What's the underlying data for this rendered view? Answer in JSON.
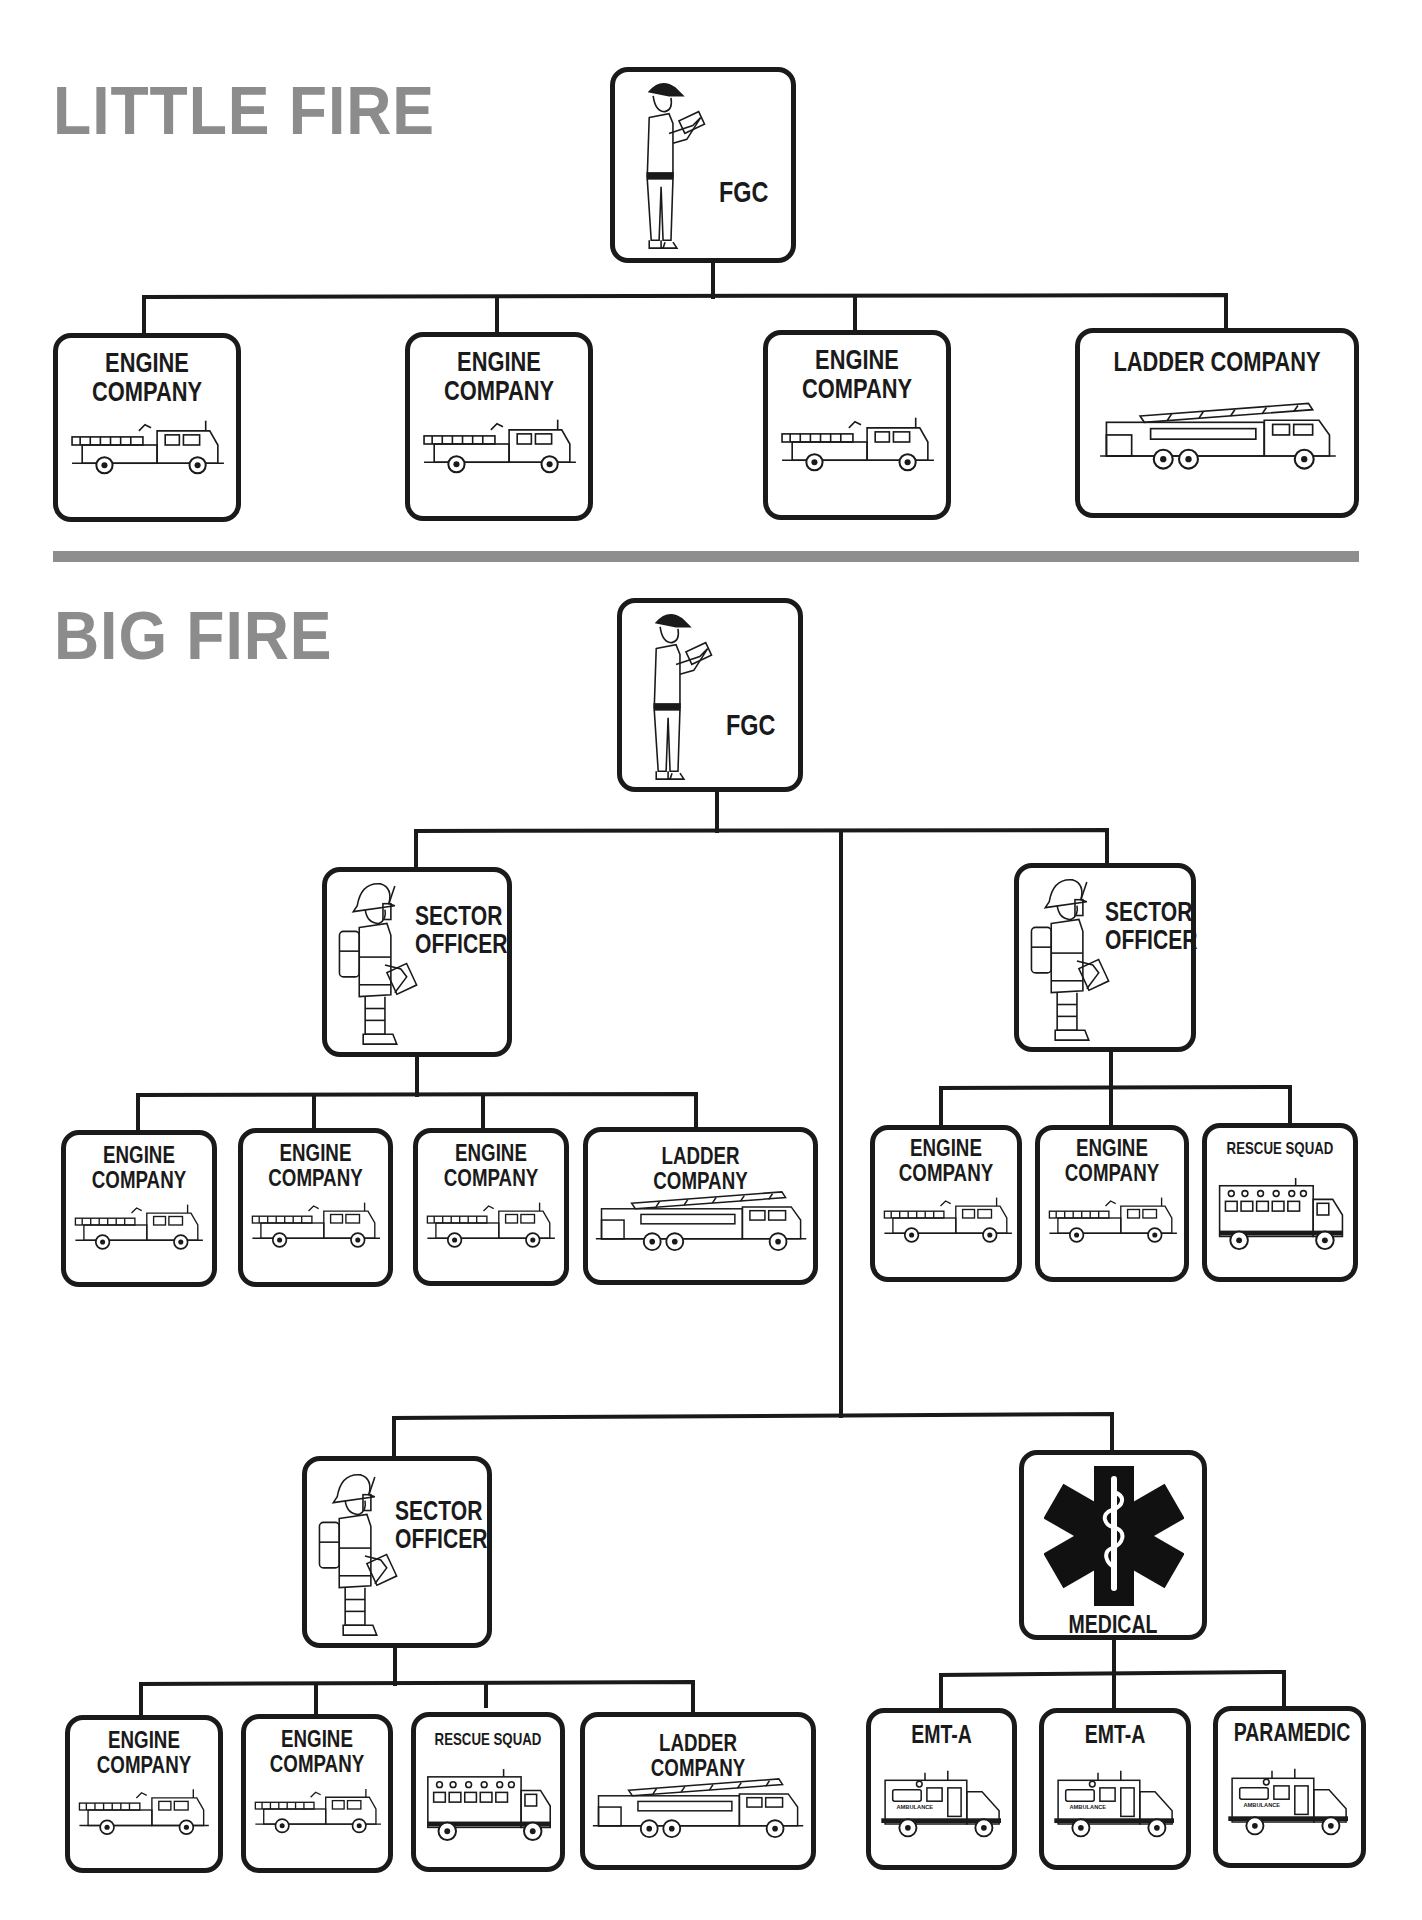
{
  "headings": {
    "little_fire": "LITTLE FIRE",
    "big_fire": "BIG FIRE"
  },
  "colors": {
    "heading_gray": "#8c8c8c",
    "rule_gray": "#8e8e8e",
    "line_black": "#1a1a1a"
  },
  "little_fire": {
    "commander": {
      "label": "FGC",
      "icon": "fire-ground-commander-icon"
    },
    "units": [
      {
        "line1": "ENGINE",
        "line2": "COMPANY",
        "icon": "engine-truck-icon"
      },
      {
        "line1": "ENGINE",
        "line2": "COMPANY",
        "icon": "engine-truck-icon"
      },
      {
        "line1": "ENGINE",
        "line2": "COMPANY",
        "icon": "engine-truck-icon"
      },
      {
        "line1": "LADDER COMPANY",
        "icon": "ladder-truck-icon"
      }
    ]
  },
  "big_fire": {
    "commander": {
      "label": "FGC",
      "icon": "fire-ground-commander-icon"
    },
    "sector_left": {
      "line1": "SECTOR",
      "line2": "OFFICER",
      "icon": "firefighter-radio-icon",
      "units": [
        {
          "line1": "ENGINE",
          "line2": "COMPANY"
        },
        {
          "line1": "ENGINE",
          "line2": "COMPANY"
        },
        {
          "line1": "ENGINE",
          "line2": "COMPANY"
        },
        {
          "line1": "LADDER COMPANY"
        }
      ]
    },
    "sector_right": {
      "line1": "SECTOR",
      "line2": "OFFICER",
      "icon": "firefighter-radio-icon",
      "units": [
        {
          "line1": "ENGINE",
          "line2": "COMPANY"
        },
        {
          "line1": "ENGINE",
          "line2": "COMPANY"
        },
        {
          "line1": "RESCUE SQUAD"
        }
      ]
    },
    "sector_bottom": {
      "line1": "SECTOR",
      "line2": "OFFICER",
      "icon": "firefighter-radio-icon",
      "units": [
        {
          "line1": "ENGINE",
          "line2": "COMPANY"
        },
        {
          "line1": "ENGINE",
          "line2": "COMPANY"
        },
        {
          "line1": "RESCUE SQUAD"
        },
        {
          "line1": "LADDER COMPANY"
        }
      ]
    },
    "medical": {
      "label": "MEDICAL",
      "icon": "star-of-life-icon",
      "units": [
        {
          "line1": "EMT-A",
          "icon": "ambulance-icon"
        },
        {
          "line1": "EMT-A",
          "icon": "ambulance-icon"
        },
        {
          "line1": "PARAMEDIC",
          "icon": "ambulance-icon"
        }
      ]
    }
  }
}
